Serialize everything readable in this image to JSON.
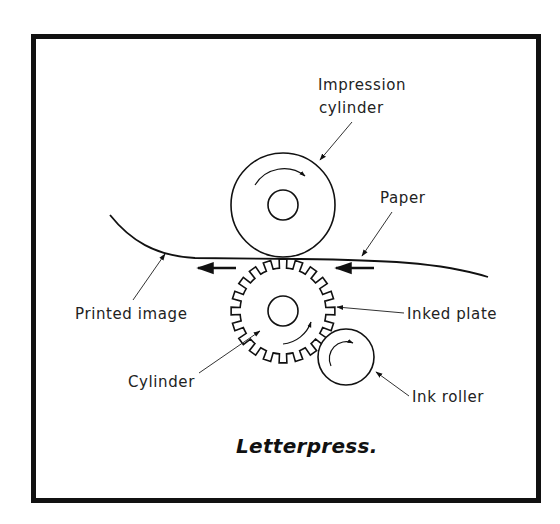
{
  "title": "Letterpress.",
  "labels": {
    "impression_cylinder_line1": "Impression",
    "impression_cylinder_line2": "cylinder",
    "paper": "Paper",
    "printed_image": "Printed image",
    "inked_plate": "Inked plate",
    "cylinder": "Cylinder",
    "ink_roller": "Ink roller"
  },
  "components": {
    "impression_cylinder": {
      "cx": 283,
      "cy": 205,
      "r": 52,
      "inner_r": 15,
      "rotation": "clockwise"
    },
    "plate_cylinder_gear": {
      "cx": 283,
      "cy": 311,
      "tip_r": 52,
      "root_r": 43,
      "teeth": 20,
      "inner_r": 15,
      "rotation": "counterclockwise"
    },
    "ink_roller": {
      "cx": 346,
      "cy": 357,
      "r": 28,
      "rotation": "clockwise"
    },
    "paper_path": {
      "direction": "right-to-left"
    }
  },
  "colors": {
    "ink": "#111111",
    "background": "#ffffff"
  }
}
